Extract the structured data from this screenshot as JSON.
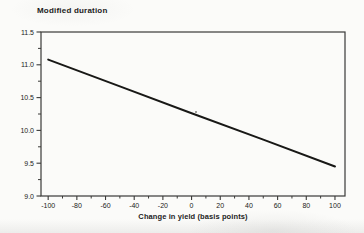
{
  "chart_data": {
    "type": "line",
    "title": "Modified duration",
    "xlabel": "Change in yield (basis points)",
    "ylabel": "Modified duration",
    "xlim": [
      -105,
      107
    ],
    "ylim": [
      9.0,
      11.5
    ],
    "grid": false,
    "legend": false,
    "x_ticks": [
      {
        "value": -100,
        "label": "-100"
      },
      {
        "value": -80,
        "label": "-80"
      },
      {
        "value": -60,
        "label": "-60"
      },
      {
        "value": -40,
        "label": "-40"
      },
      {
        "value": -20,
        "label": "-20"
      },
      {
        "value": 0,
        "label": "0"
      },
      {
        "value": 20,
        "label": "20"
      },
      {
        "value": 40,
        "label": "40"
      },
      {
        "value": 60,
        "label": "60"
      },
      {
        "value": 80,
        "label": "80"
      },
      {
        "value": 100,
        "label": "100"
      }
    ],
    "x_minor_tick_step": 10,
    "y_ticks": [
      {
        "value": 9.0,
        "label": "9.0"
      },
      {
        "value": 9.5,
        "label": "9.5"
      },
      {
        "value": 10.0,
        "label": "10.0"
      },
      {
        "value": 10.5,
        "label": "10.5"
      },
      {
        "value": 11.0,
        "label": "11.0"
      },
      {
        "value": 11.5,
        "label": "11.5"
      }
    ],
    "y_minor_tick_step": 0.25,
    "series": [
      {
        "name": "modified duration vs change in yield",
        "x": [
          -100,
          -50,
          0,
          50,
          100
        ],
        "y": [
          11.08,
          10.67,
          10.26,
          9.86,
          9.45
        ],
        "color": "#181816",
        "stroke_width": 2
      }
    ]
  },
  "colors": {
    "axis": "#3a3a38",
    "tick_text": "#222220",
    "line": "#181816",
    "background": "#fbfbf9"
  }
}
